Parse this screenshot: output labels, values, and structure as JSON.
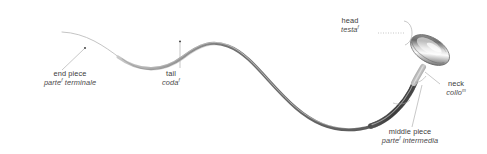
{
  "diagram": {
    "background_color": "#ffffff",
    "label_color": "#3c3c3c",
    "leader_line_color": "#9a9a9a",
    "cell_outline_color": "#6e6e6e",
    "cell_fill_light": "#f2f2f2",
    "cell_fill_mid": "#b4b4b4",
    "cell_fill_dark": "#4f4f4f",
    "labels": [
      {
        "id": "end-piece",
        "english": "end piece",
        "italian": "parte",
        "italian_suffix": " terminale",
        "superscript": "f"
      },
      {
        "id": "tail",
        "english": "tail",
        "italian": "coda",
        "italian_suffix": "",
        "superscript": "f"
      },
      {
        "id": "head",
        "english": "head",
        "italian": "testa",
        "italian_suffix": "",
        "superscript": "f"
      },
      {
        "id": "neck",
        "english": "neck",
        "italian": "collo",
        "italian_suffix": "",
        "superscript": "m"
      },
      {
        "id": "middle-piece",
        "english": "middle piece",
        "italian": "parte",
        "italian_suffix": " intermedia",
        "superscript": "f"
      }
    ]
  }
}
